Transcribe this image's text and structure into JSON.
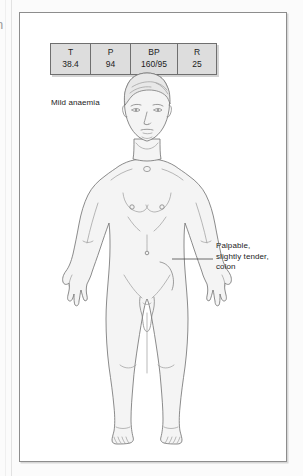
{
  "page": {
    "margin_glyph": "n"
  },
  "vitals_table": {
    "name": "vital-signs-table",
    "columns": [
      {
        "label": "T",
        "value": "38.4",
        "meaning": "temperature"
      },
      {
        "label": "P",
        "value": "94",
        "meaning": "pulse"
      },
      {
        "label": "BP",
        "value": "160/95",
        "meaning": "blood-pressure"
      },
      {
        "label": "R",
        "value": "25",
        "meaning": "respiratory-rate"
      }
    ]
  },
  "annotations": {
    "anaemia_note": "Mild anaemia",
    "callout": {
      "line1": "Palpable,",
      "line2": "slightly tender,",
      "line3": "colon"
    }
  },
  "colors": {
    "panel_border": "#8d8d8d",
    "table_fill": "#dddddd",
    "table_border": "#6f6f6f",
    "body_fill": "#f4f4f4",
    "body_stroke": "#6e6e6e",
    "text": "#1c1c1c",
    "leader_line": "#4a4a4a"
  }
}
